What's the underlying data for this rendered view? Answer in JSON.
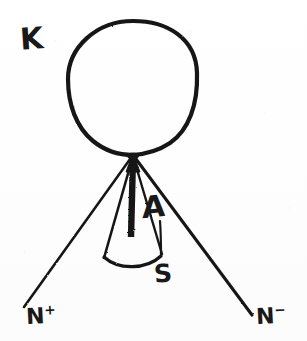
{
  "figure": {
    "ink_color": "#191919",
    "paper_color": "#fdfdfd",
    "width": 307,
    "height": 341
  },
  "labels": {
    "k": "K",
    "a": "A",
    "s": "S",
    "n_plus_base": "N",
    "n_plus_sup": "+",
    "n_minus_base": "N",
    "n_minus_sup": "−"
  },
  "geometry": {
    "circle": {
      "cx": 133,
      "cy": 88,
      "rx": 65,
      "ry": 67
    },
    "apex": {
      "x": 133,
      "y": 155
    },
    "rays": [
      {
        "name": "n-plus-ray",
        "x1": 133,
        "y1": 155,
        "x2": 24,
        "y2": 307
      },
      {
        "name": "n-minus-ray",
        "x1": 133,
        "y1": 155,
        "x2": 252,
        "y2": 315
      },
      {
        "name": "cone-left-edge",
        "x1": 133,
        "y1": 155,
        "x2": 104,
        "y2": 258
      },
      {
        "name": "cone-right-edge",
        "x1": 133,
        "y1": 155,
        "x2": 162,
        "y2": 256
      }
    ],
    "arrow_a": {
      "x1": 133,
      "y1": 157,
      "x2": 131,
      "y2": 236,
      "stroke_width": 6
    },
    "cone_base_arc": {
      "x1": 104,
      "y1": 258,
      "x2": 161,
      "y2": 257,
      "sag": 10
    },
    "s_leader": {
      "x1": 160,
      "y1": 222,
      "x2": 161,
      "y2": 257
    }
  }
}
